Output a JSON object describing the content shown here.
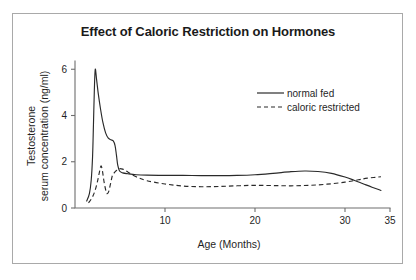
{
  "figure": {
    "title": "Effect of Caloric Restriction on Hormones",
    "border_color": "#a9a9a9",
    "background_color": "#ffffff",
    "ink_color": "#2a2a2a"
  },
  "chart_data": {
    "type": "line",
    "title": "Effect of Caloric Restriction on Hormones",
    "xlabel": "Age (Months)",
    "ylabel": "Testosterone serum concentration (ng/ml)",
    "ylabel_line1": "Testosterone",
    "ylabel_line2": "serum concentration (ng/ml)",
    "xlim": [
      0,
      35
    ],
    "ylim": [
      0,
      6.4
    ],
    "xticks": [
      10,
      20,
      30,
      35
    ],
    "xtick_labels": [
      "10",
      "20",
      "30",
      "35"
    ],
    "yticks": [
      0,
      2,
      4,
      6
    ],
    "ytick_labels": [
      "0",
      "2",
      "4",
      "6"
    ],
    "grid": false,
    "legend_position": "upper right",
    "series": [
      {
        "name": "normal fed",
        "style": "solid",
        "points": [
          [
            1.3,
            0.3
          ],
          [
            1.6,
            0.62
          ],
          [
            1.8,
            1.2
          ],
          [
            1.95,
            2.2
          ],
          [
            2.05,
            3.6
          ],
          [
            2.15,
            5.1
          ],
          [
            2.25,
            6.0
          ],
          [
            2.4,
            5.55
          ],
          [
            2.6,
            4.9
          ],
          [
            2.85,
            4.25
          ],
          [
            3.1,
            3.7
          ],
          [
            3.4,
            3.25
          ],
          [
            3.7,
            3.02
          ],
          [
            4.0,
            2.95
          ],
          [
            4.25,
            2.9
          ],
          [
            4.45,
            2.7
          ],
          [
            4.6,
            2.3
          ],
          [
            4.75,
            1.85
          ],
          [
            4.95,
            1.6
          ],
          [
            5.3,
            1.52
          ],
          [
            5.9,
            1.48
          ],
          [
            6.8,
            1.44
          ],
          [
            8.0,
            1.42
          ],
          [
            10.0,
            1.41
          ],
          [
            12.0,
            1.41
          ],
          [
            14.0,
            1.4
          ],
          [
            16.0,
            1.4
          ],
          [
            18.0,
            1.41
          ],
          [
            20.0,
            1.44
          ],
          [
            22.0,
            1.5
          ],
          [
            24.0,
            1.57
          ],
          [
            25.5,
            1.6
          ],
          [
            27.0,
            1.58
          ],
          [
            28.5,
            1.5
          ],
          [
            30.0,
            1.34
          ],
          [
            31.0,
            1.2
          ],
          [
            32.0,
            1.05
          ],
          [
            33.0,
            0.9
          ],
          [
            34.0,
            0.76
          ]
        ]
      },
      {
        "name": "caloric restricted",
        "style": "dashed",
        "points": [
          [
            1.5,
            0.22
          ],
          [
            1.9,
            0.45
          ],
          [
            2.2,
            0.72
          ],
          [
            2.5,
            1.15
          ],
          [
            2.75,
            1.62
          ],
          [
            2.9,
            1.82
          ],
          [
            3.05,
            1.6
          ],
          [
            3.2,
            1.2
          ],
          [
            3.4,
            0.8
          ],
          [
            3.55,
            0.62
          ],
          [
            3.75,
            0.72
          ],
          [
            3.95,
            1.05
          ],
          [
            4.15,
            1.4
          ],
          [
            4.35,
            1.52
          ],
          [
            4.6,
            1.62
          ],
          [
            4.9,
            1.7
          ],
          [
            5.3,
            1.68
          ],
          [
            5.9,
            1.55
          ],
          [
            6.8,
            1.35
          ],
          [
            8.0,
            1.18
          ],
          [
            10.0,
            1.04
          ],
          [
            12.0,
            0.95
          ],
          [
            14.0,
            0.92
          ],
          [
            16.0,
            0.93
          ],
          [
            18.0,
            0.96
          ],
          [
            20.0,
            0.98
          ],
          [
            22.0,
            0.97
          ],
          [
            24.0,
            0.96
          ],
          [
            26.0,
            0.98
          ],
          [
            28.0,
            1.03
          ],
          [
            30.0,
            1.12
          ],
          [
            31.5,
            1.22
          ],
          [
            32.5,
            1.29
          ],
          [
            34.0,
            1.35
          ]
        ]
      }
    ],
    "legend": [
      {
        "label": "normal fed",
        "style": "solid"
      },
      {
        "label": "caloric restricted",
        "style": "dashed"
      }
    ]
  }
}
